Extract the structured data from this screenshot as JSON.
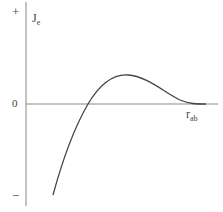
{
  "diagram": {
    "y_axis": {
      "label": "J",
      "label_subscript": "e",
      "plus_sign": "+",
      "minus_sign": "−",
      "zero_label": "0"
    },
    "x_axis": {
      "label": "r",
      "label_subscript": "ab"
    },
    "curve": {
      "description": "Curve rising from large negative values, crossing zero, reaching a positive maximum, then decaying asymptotically to zero as r_ab increases"
    },
    "colors": {
      "axis": "#888888",
      "curve": "#444444",
      "text": "#444444"
    }
  }
}
